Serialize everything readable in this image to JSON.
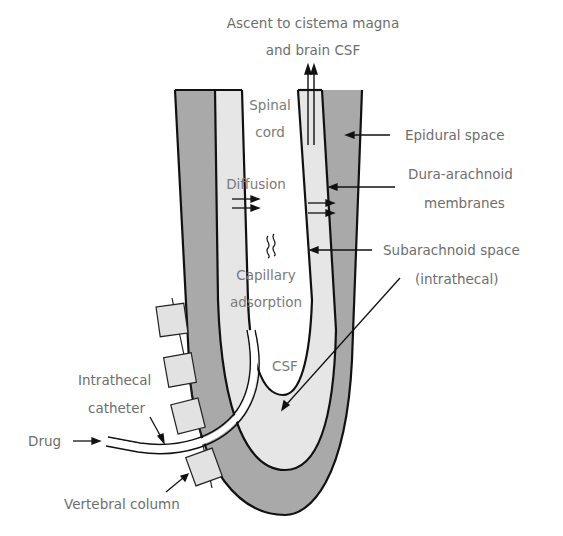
{
  "diagram": {
    "title_lines": [
      "Ascent to cistema magna",
      "and brain CSF"
    ],
    "inner_labels": {
      "spinal_cord": [
        "Spinal",
        "cord"
      ],
      "diffusion": "Diffusion",
      "capillary": [
        "Capillary",
        "adsorption"
      ],
      "csf": "CSF"
    },
    "right_labels": {
      "epidural": "Epidural space",
      "dura": [
        "Dura-arachnoid",
        "membranes"
      ],
      "subarachnoid": [
        "Subarachnoid space",
        "(intrathecal)"
      ]
    },
    "left_labels": {
      "catheter": [
        "Intrathecal",
        "catheter"
      ],
      "drug": "Drug",
      "vertebral": "Vertebral column"
    },
    "colors": {
      "dura_gray": "#a9a9a9",
      "csf_light": "#e6e6e6",
      "outline": "#111111",
      "text": "#6e6e6e",
      "vertebra_fill": "#e2e2e2"
    }
  }
}
